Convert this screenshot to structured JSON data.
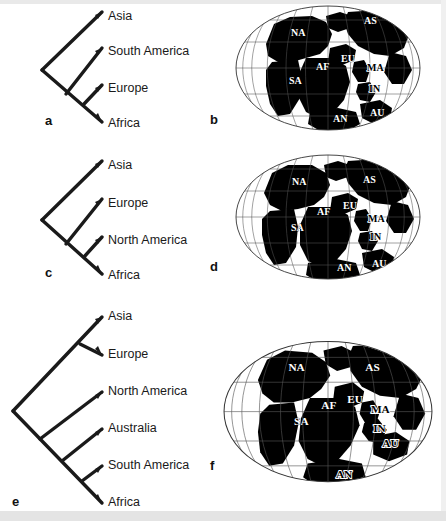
{
  "figure": {
    "background_color": "#ffffff",
    "line_color": "#1a1a1a",
    "land_color": "#000000",
    "ocean_color": "#ffffff"
  },
  "panels": [
    {
      "letter": "a",
      "type": "cladogram",
      "taxa": [
        "Asia",
        "South America",
        "Europe",
        "Africa"
      ],
      "topology": "(((Asia,(South America,(Europe,Africa)))))"
    },
    {
      "letter": "b",
      "type": "map",
      "labels": [
        "NA",
        "AS",
        "EU",
        "AF",
        "MA",
        "SA",
        "IN",
        "AN",
        "AU"
      ]
    },
    {
      "letter": "c",
      "type": "cladogram",
      "taxa": [
        "Asia",
        "Europe",
        "North America",
        "Africa"
      ],
      "topology": "(Asia,(Europe,(North America,Africa)))"
    },
    {
      "letter": "d",
      "type": "map",
      "labels": [
        "NA",
        "AS",
        "EU",
        "AF",
        "MA",
        "SA",
        "IN",
        "AN",
        "AU"
      ]
    },
    {
      "letter": "e",
      "type": "cladogram",
      "taxa": [
        "Asia",
        "Europe",
        "North America",
        "Australia",
        "South America",
        "Africa"
      ],
      "topology": "((Asia,Europe),(North America,(Australia,(South America,Africa))))"
    },
    {
      "letter": "f",
      "type": "map",
      "labels": [
        "NA",
        "AS",
        "EU",
        "AF",
        "MA",
        "SA",
        "IN",
        "AN",
        "AU"
      ]
    }
  ],
  "tree_a": {
    "letter": "a",
    "tips": [
      {
        "label": "Asia",
        "x": 108,
        "y": 16
      },
      {
        "label": "South America",
        "x": 108,
        "y": 51
      },
      {
        "label": "Europe",
        "x": 108,
        "y": 88
      },
      {
        "label": "Africa",
        "x": 108,
        "y": 122
      }
    ]
  },
  "tree_c": {
    "letter": "c",
    "tips": [
      {
        "label": "Asia",
        "x": 108,
        "y": 163
      },
      {
        "label": "Europe",
        "x": 108,
        "y": 201
      },
      {
        "label": "North America",
        "x": 108,
        "y": 237
      },
      {
        "label": "Africa",
        "x": 108,
        "y": 274
      }
    ]
  },
  "tree_e": {
    "letter": "e",
    "tips": [
      {
        "label": "Asia",
        "x": 108,
        "y": 315
      },
      {
        "label": "Europe",
        "x": 108,
        "y": 353
      },
      {
        "label": "North America",
        "x": 108,
        "y": 390
      },
      {
        "label": "Australia",
        "x": 108,
        "y": 427
      },
      {
        "label": "South America",
        "x": 108,
        "y": 464
      },
      {
        "label": "Africa",
        "x": 108,
        "y": 501
      }
    ]
  },
  "map_b": {
    "letter": "b",
    "labels": [
      {
        "text": "NA",
        "x": 63,
        "y": 36,
        "style": "light"
      },
      {
        "text": "AS",
        "x": 136,
        "y": 24,
        "style": "light"
      },
      {
        "text": "EU",
        "x": 113,
        "y": 62,
        "style": "light"
      },
      {
        "text": "AF",
        "x": 88,
        "y": 70,
        "style": "light"
      },
      {
        "text": "MA",
        "x": 139,
        "y": 71,
        "style": "dark"
      },
      {
        "text": "SA",
        "x": 61,
        "y": 84,
        "style": "light"
      },
      {
        "text": "IN",
        "x": 141,
        "y": 92,
        "style": "dark"
      },
      {
        "text": "AN",
        "x": 105,
        "y": 116,
        "style": "light"
      },
      {
        "text": "AU",
        "x": 142,
        "y": 114,
        "style": "light"
      }
    ]
  },
  "map_d": {
    "letter": "d",
    "labels": [
      {
        "text": "NA",
        "x": 64,
        "y": 38,
        "style": "light"
      },
      {
        "text": "AS",
        "x": 135,
        "y": 36,
        "style": "light"
      },
      {
        "text": "EU",
        "x": 115,
        "y": 61,
        "style": "light"
      },
      {
        "text": "AF",
        "x": 89,
        "y": 67,
        "style": "light"
      },
      {
        "text": "MA",
        "x": 140,
        "y": 74,
        "style": "dark"
      },
      {
        "text": "SA",
        "x": 63,
        "y": 82,
        "style": "light"
      },
      {
        "text": "IN",
        "x": 142,
        "y": 90,
        "style": "dark"
      },
      {
        "text": "AN",
        "x": 109,
        "y": 117,
        "style": "light"
      },
      {
        "text": "AU",
        "x": 144,
        "y": 114,
        "style": "light"
      }
    ]
  },
  "map_f": {
    "letter": "f",
    "labels": [
      {
        "text": "NA",
        "x": 65,
        "y": 32,
        "style": "light"
      },
      {
        "text": "AS",
        "x": 133,
        "y": 32,
        "style": "light"
      },
      {
        "text": "EU",
        "x": 117,
        "y": 61,
        "style": "light"
      },
      {
        "text": "AF",
        "x": 94,
        "y": 67,
        "style": "light"
      },
      {
        "text": "MA",
        "x": 138,
        "y": 70,
        "style": "dark"
      },
      {
        "text": "SA",
        "x": 70,
        "y": 80,
        "style": "light"
      },
      {
        "text": "IN",
        "x": 140,
        "y": 86,
        "style": "dark"
      },
      {
        "text": "AU",
        "x": 148,
        "y": 99,
        "style": "dark"
      },
      {
        "text": "AN",
        "x": 107,
        "y": 122,
        "style": "dark"
      }
    ]
  }
}
